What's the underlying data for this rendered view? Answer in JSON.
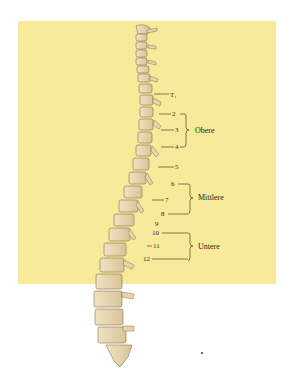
{
  "figure": {
    "background_color": "#f7ea98",
    "vertebra_labels": [
      {
        "id": "t1",
        "label": "T₁",
        "x": 170,
        "y": 91
      },
      {
        "id": "t2",
        "label": "2",
        "x": 172,
        "y": 111
      },
      {
        "id": "t3",
        "label": "3",
        "x": 175,
        "y": 127
      },
      {
        "id": "t4",
        "label": "4",
        "x": 175,
        "y": 144
      },
      {
        "id": "t5",
        "label": "5",
        "x": 175,
        "y": 164
      },
      {
        "id": "t6",
        "label": "6",
        "x": 171,
        "y": 181
      },
      {
        "id": "t7",
        "label": "7",
        "x": 165,
        "y": 197
      },
      {
        "id": "t8",
        "label": "8",
        "x": 160,
        "y": 211
      },
      {
        "id": "t9",
        "label": "9",
        "x": 155,
        "y": 221
      },
      {
        "id": "t10",
        "label": "10",
        "x": 152,
        "y": 231
      },
      {
        "id": "t11",
        "label": "11",
        "x": 148,
        "y": 243
      },
      {
        "id": "t12",
        "label": "12",
        "x": 144,
        "y": 256
      }
    ],
    "groups": [
      {
        "id": "upper",
        "label": "Obere",
        "x": 195,
        "y": 127
      },
      {
        "id": "middle",
        "label": "Mittlere",
        "x": 198,
        "y": 194
      },
      {
        "id": "lower",
        "label": "Untere",
        "x": 198,
        "y": 242
      }
    ]
  }
}
